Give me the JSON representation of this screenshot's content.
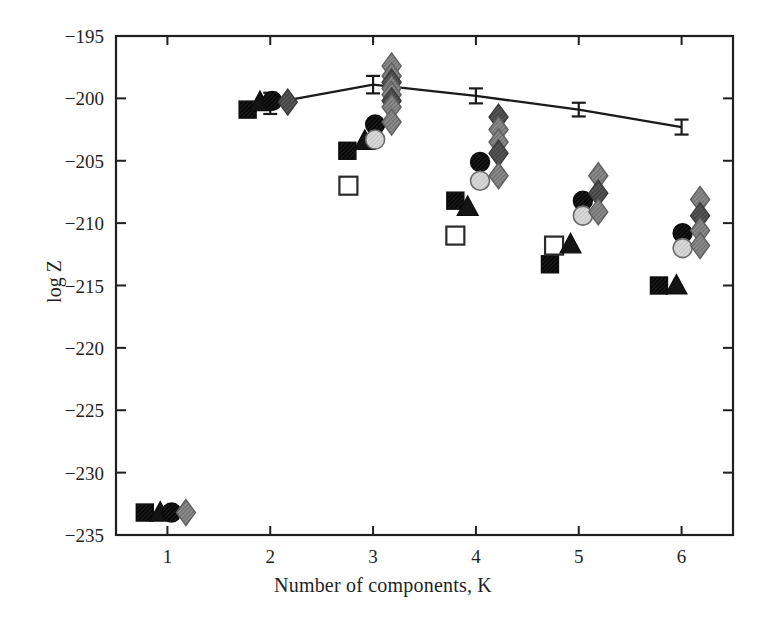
{
  "chart_data": {
    "type": "scatter",
    "title": "",
    "subtitle": "",
    "xlabel": "Number of components, K",
    "ylabel": "log Z",
    "xlim": [
      0.5,
      6.5
    ],
    "ylim": [
      -235,
      -195
    ],
    "grid": false,
    "legend": "none",
    "xticks": [
      1,
      2,
      3,
      4,
      5,
      6
    ],
    "xtick_labels": [
      "1",
      "2",
      "3",
      "4",
      "5",
      "6"
    ],
    "yticks": [
      -195,
      -200,
      -205,
      -210,
      -215,
      -220,
      -225,
      -230,
      -235
    ],
    "ytick_labels": [
      "−195",
      "−200",
      "−205",
      "−210",
      "−215",
      "−220",
      "−225",
      "−230",
      "−235"
    ],
    "series": [
      {
        "name": "error-bar line",
        "marker": "errorbar-line",
        "color": "#1a1a1a",
        "connected": true,
        "x": [
          2.0,
          3.0,
          4.0,
          5.0,
          6.0
        ],
        "values": [
          -200.4,
          -198.9,
          -199.8,
          -200.9,
          -202.3
        ],
        "yerr": [
          0.85,
          0.7,
          0.6,
          0.55,
          0.6
        ]
      },
      {
        "name": "filled square",
        "marker": "filled-square",
        "color": "#1a1a1a",
        "connected": false,
        "x": [
          0.78,
          1.78,
          2.75,
          3.8,
          4.72,
          5.78
        ],
        "values": [
          -233.2,
          -200.9,
          -204.2,
          -208.2,
          -213.3,
          -215.0
        ]
      },
      {
        "name": "open square",
        "marker": "open-square",
        "color": "#1a1a1a",
        "connected": false,
        "x": [
          2.76,
          3.8,
          4.76
        ],
        "values": [
          -207.0,
          -211.0,
          -211.8
        ]
      },
      {
        "name": "filled triangle",
        "marker": "filled-triangle",
        "color": "#1a1a1a",
        "connected": false,
        "x": [
          0.93,
          1.9,
          2.92,
          3.92,
          4.92,
          5.95
        ],
        "values": [
          -233.2,
          -200.3,
          -203.4,
          -208.7,
          -211.7,
          -215.0
        ]
      },
      {
        "name": "filled circle",
        "marker": "filled-circle",
        "color": "#141414",
        "connected": false,
        "x": [
          1.04,
          2.02,
          3.02,
          4.04,
          5.04,
          6.01
        ],
        "values": [
          -233.2,
          -200.2,
          -202.1,
          -205.1,
          -208.2,
          -210.8
        ]
      },
      {
        "name": "light circle",
        "marker": "light-circle",
        "color": "#cfcfcf",
        "connected": false,
        "x": [
          3.02,
          4.04,
          5.04,
          6.01
        ],
        "values": [
          -203.3,
          -206.6,
          -209.4,
          -212.0
        ]
      },
      {
        "name": "gray diamond",
        "marker": "gray-diamond",
        "color": "#8a8a8a",
        "connected": false,
        "x": [
          1.18,
          2.17,
          3.18,
          3.18,
          3.18,
          3.18,
          3.18,
          3.18,
          3.18,
          3.18,
          4.22,
          4.22,
          4.22,
          4.22,
          4.22,
          5.19,
          5.19,
          5.19,
          6.18,
          6.18,
          6.18,
          6.18
        ],
        "values": [
          -233.2,
          -200.3,
          -197.4,
          -198.2,
          -198.7,
          -199.2,
          -199.7,
          -200.2,
          -200.7,
          -201.9,
          -201.5,
          -202.5,
          -203.5,
          -204.4,
          -206.2,
          -206.2,
          -207.6,
          -209.1,
          -208.1,
          -209.4,
          -210.6,
          -211.8
        ]
      }
    ]
  },
  "axes": {
    "x_axis_name": "Number of components, K",
    "y_axis_name": "log Z"
  }
}
